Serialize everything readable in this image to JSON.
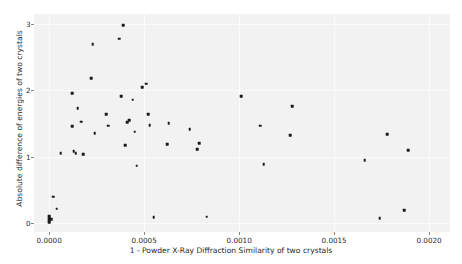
{
  "chart_data": {
    "type": "scatter",
    "title": "",
    "xlabel": "1 - Powder X-Ray Diffraction Similarity of two crystals",
    "ylabel": "Absolute difference of energies of two crystals",
    "xlim": [
      -8e-05,
      0.00211
    ],
    "ylim": [
      -0.13,
      3.15
    ],
    "xticks": [
      0.0,
      0.0005,
      0.001,
      0.0015,
      0.002
    ],
    "xticklabels": [
      "0.0000",
      "0.0005",
      "0.0010",
      "0.0015",
      "0.0020"
    ],
    "yticks": [
      0,
      1,
      2,
      3
    ],
    "yticklabels": [
      "0",
      "1",
      "2",
      "3"
    ],
    "grid": true,
    "grid_color": "#fbfbfb",
    "plot_bgcolor": "#f2f2f2",
    "figure_bgcolor": "#ffffff",
    "marker_color": "#1b1b1b",
    "marker_size": 2.6,
    "legend": null,
    "series": [
      {
        "name": "crystal pairs",
        "points": [
          [
            0.0,
            0.02
          ],
          [
            0.0,
            0.05
          ],
          [
            0.0,
            0.08
          ],
          [
            0.0,
            0.11
          ],
          [
            1e-05,
            0.06
          ],
          [
            2e-05,
            0.4
          ],
          [
            4e-05,
            0.22
          ],
          [
            6e-05,
            1.06
          ],
          [
            0.00012,
            1.96
          ],
          [
            0.00012,
            1.46
          ],
          [
            0.00013,
            1.09
          ],
          [
            0.00014,
            1.06
          ],
          [
            0.00015,
            1.73
          ],
          [
            0.00017,
            1.53
          ],
          [
            0.00018,
            1.04
          ],
          [
            0.00022,
            2.18
          ],
          [
            0.00023,
            2.7
          ],
          [
            0.00024,
            1.36
          ],
          [
            0.0003,
            1.64
          ],
          [
            0.00031,
            1.47
          ],
          [
            0.00037,
            2.78
          ],
          [
            0.00038,
            1.91
          ],
          [
            0.00039,
            2.98
          ],
          [
            0.0004,
            1.18
          ],
          [
            0.00041,
            1.52
          ],
          [
            0.00042,
            1.55
          ],
          [
            0.00044,
            1.86
          ],
          [
            0.00045,
            1.38
          ],
          [
            0.00046,
            0.87
          ],
          [
            0.00049,
            2.05
          ],
          [
            0.00051,
            2.1
          ],
          [
            0.00052,
            1.64
          ],
          [
            0.00053,
            1.48
          ],
          [
            0.00055,
            0.09
          ],
          [
            0.00062,
            1.19
          ],
          [
            0.00063,
            1.51
          ],
          [
            0.00074,
            1.42
          ],
          [
            0.00078,
            1.12
          ],
          [
            0.00079,
            1.21
          ],
          [
            0.00083,
            0.1
          ],
          [
            0.00101,
            1.91
          ],
          [
            0.00111,
            1.47
          ],
          [
            0.00113,
            0.89
          ],
          [
            0.00127,
            1.33
          ],
          [
            0.00128,
            1.76
          ],
          [
            0.00166,
            0.95
          ],
          [
            0.00174,
            0.08
          ],
          [
            0.00178,
            1.34
          ],
          [
            0.00187,
            0.2
          ],
          [
            0.00189,
            1.1
          ]
        ]
      }
    ]
  }
}
